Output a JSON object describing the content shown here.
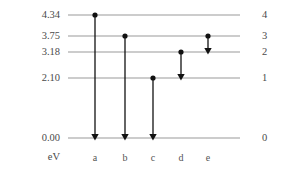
{
  "figure": {
    "kind": "energy-level-diagram",
    "unit_label": "eV",
    "line_color": "#9a9a9a",
    "arrow_color": "#111111",
    "text_color": "#4a4a4a",
    "background_color": "#ffffff"
  },
  "chart_data": {
    "type": "diagram",
    "title": "",
    "xlabel": "",
    "ylabel": "eV",
    "grid": false,
    "legend": null,
    "ylim": [
      0.0,
      4.34
    ],
    "axis_geometry": {
      "line_x_start": 68,
      "line_x_end": 240,
      "canvas_width": 291,
      "canvas_height": 172
    },
    "levels": [
      {
        "energy_label": "4.34",
        "energy": 4.34,
        "quantum_number": "4",
        "n": 4,
        "y": 15
      },
      {
        "energy_label": "3.75",
        "energy": 3.75,
        "quantum_number": "3",
        "n": 3,
        "y": 36
      },
      {
        "energy_label": "3.18",
        "energy": 3.18,
        "quantum_number": "2",
        "n": 2,
        "y": 52
      },
      {
        "energy_label": "2.10",
        "energy": 2.1,
        "quantum_number": "1",
        "n": 1,
        "y": 78
      },
      {
        "energy_label": "0.00",
        "energy": 0.0,
        "quantum_number": "0",
        "n": 0,
        "y": 138
      }
    ],
    "transitions": [
      {
        "label": "a",
        "x": 95,
        "from_energy": 4.34,
        "to_energy": 0.0,
        "from_n": 4,
        "to_n": 0,
        "y_start": 15,
        "y_end": 138,
        "delta_energy": 4.34
      },
      {
        "label": "b",
        "x": 125,
        "from_energy": 3.75,
        "to_energy": 0.0,
        "from_n": 3,
        "to_n": 0,
        "y_start": 36,
        "y_end": 138,
        "delta_energy": 3.75
      },
      {
        "label": "c",
        "x": 153,
        "from_energy": 2.1,
        "to_energy": 0.0,
        "from_n": 1,
        "to_n": 0,
        "y_start": 78,
        "y_end": 138,
        "delta_energy": 2.1
      },
      {
        "label": "d",
        "x": 181,
        "from_energy": 3.18,
        "to_energy": 2.1,
        "from_n": 2,
        "to_n": 1,
        "y_start": 52,
        "y_end": 78,
        "delta_energy": 1.08
      },
      {
        "label": "e",
        "x": 208,
        "from_energy": 3.75,
        "to_energy": 3.18,
        "from_n": 3,
        "to_n": 2,
        "y_start": 36,
        "y_end": 52,
        "delta_energy": 0.57
      }
    ],
    "letter_row_y": 158
  }
}
